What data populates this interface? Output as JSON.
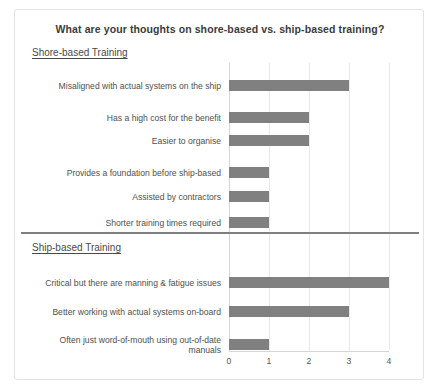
{
  "card": {
    "title": "What are your thoughts on shore-based vs. ship-based training?"
  },
  "sections": {
    "shore_heading": "Shore-based Training",
    "ship_heading": "Ship-based Training"
  },
  "chart_data": {
    "type": "bar",
    "orientation": "horizontal",
    "title": "What are your thoughts on shore-based vs. ship-based training?",
    "xlabel": "",
    "ylabel": "",
    "xlim": [
      0,
      4
    ],
    "xticks": [
      0,
      1,
      2,
      3,
      4
    ],
    "xtick_labels": [
      "0",
      "1",
      "2",
      "3",
      "4"
    ],
    "grid": true,
    "legend": false,
    "groups": [
      {
        "name": "Shore-based Training",
        "categories": [
          "Misaligned with actual systems on the ship",
          "Has a high cost for the benefit",
          "Easier to organise",
          "Provides a foundation before ship-based",
          "Assisted by contractors",
          "Shorter training times required"
        ],
        "values": [
          3,
          2,
          2,
          1,
          1,
          1
        ]
      },
      {
        "name": "Ship-based Training",
        "categories": [
          "Critical but there are manning & fatigue issues",
          "Better working with actual systems on-board",
          "Often just word-of-mouth using out-of-date manuals"
        ],
        "values": [
          4,
          3,
          1
        ]
      }
    ],
    "bar_color": "#808080",
    "grid_color": "#e9e9e9",
    "divider_color": "#7f7f7f"
  },
  "bars": [
    {
      "label": "Misaligned with actual systems on the ship",
      "value": 3
    },
    {
      "label": "Has a high cost for the benefit",
      "value": 2
    },
    {
      "label": "Easier to organise",
      "value": 2
    },
    {
      "label": "Provides a foundation before ship-based",
      "value": 1
    },
    {
      "label": "Assisted by contractors",
      "value": 1
    },
    {
      "label": "Shorter training times required",
      "value": 1
    },
    {
      "label": "Critical but there are manning & fatigue issues",
      "value": 4
    },
    {
      "label": "Better working with actual systems on-board",
      "value": 3
    },
    {
      "label": "Often just word-of-mouth using out-of-date\nmanuals",
      "value": 1
    }
  ],
  "axis": {
    "ticks": [
      "0",
      "1",
      "2",
      "3",
      "4"
    ]
  }
}
